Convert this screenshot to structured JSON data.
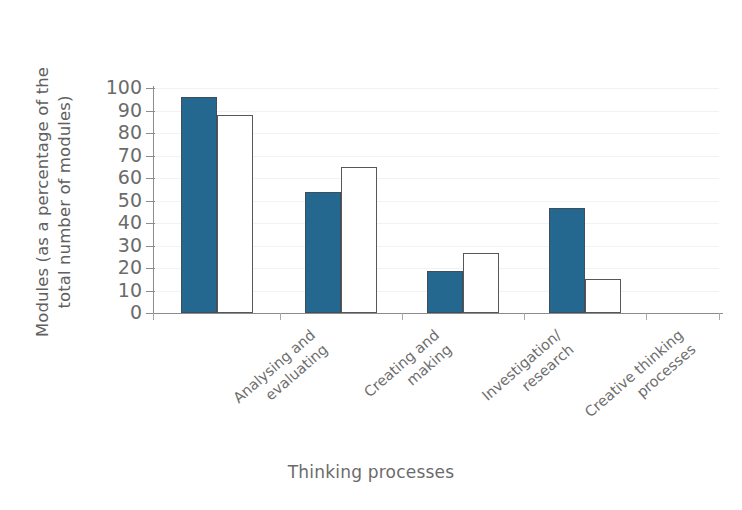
{
  "chart_data": {
    "type": "bar",
    "title": "",
    "xlabel": "Thinking processes",
    "ylabel": "Modules (as a percentage of the total number of modules)",
    "ylabel_line1": "Modules (as a percentage of the",
    "ylabel_line2": "total number of modules)",
    "ylim": [
      0,
      100
    ],
    "yticks": [
      0,
      10,
      20,
      30,
      40,
      50,
      60,
      70,
      80,
      90,
      100
    ],
    "ytick_labels": [
      "0",
      "10",
      "20",
      "30",
      "40",
      "50",
      "60",
      "70",
      "80",
      "90",
      "100"
    ],
    "grid": false,
    "legend": "none",
    "categories": [
      "Analysing and evaluating",
      "Creating and making",
      "Investigation/research",
      "Creative thinking processes"
    ],
    "category_lines": [
      [
        "Analysing and",
        "evaluating"
      ],
      [
        "Creating and",
        "making"
      ],
      [
        "Investigation/",
        "research"
      ],
      [
        "Creative thinking",
        "processes"
      ]
    ],
    "series": [
      {
        "name": "series-filled",
        "style": "filled",
        "color": "#24688f",
        "values": [
          96,
          54,
          18.5,
          46.5
        ]
      },
      {
        "name": "series-hollow",
        "style": "hollow",
        "color": "#ffffff",
        "values": [
          88,
          65,
          26.5,
          15
        ]
      }
    ]
  },
  "colors": {
    "bar_fill": "#24688f",
    "bar_outline": "#575757",
    "axis": "#8c8c8c",
    "text": "#6b6b6b",
    "background": "#ffffff"
  }
}
